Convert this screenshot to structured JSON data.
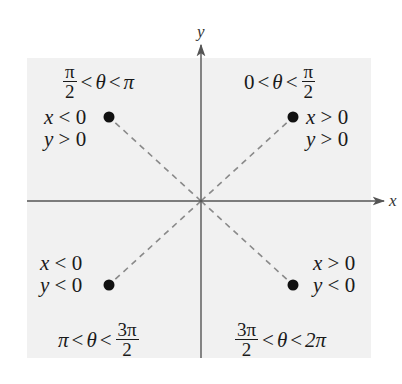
{
  "diagram": {
    "axes": {
      "x_label": "x",
      "y_label": "y"
    },
    "quadrants": [
      {
        "id": "Q1",
        "range": {
          "lower": "0",
          "theta": "θ",
          "upper_num": "π",
          "upper_den": "2",
          "lt": "<"
        },
        "conditions": [
          "x > 0",
          "y > 0"
        ],
        "cond_x": {
          "var": "x",
          "rel": " > 0"
        },
        "cond_y": {
          "var": "y",
          "rel": " > 0"
        }
      },
      {
        "id": "Q2",
        "range": {
          "lower_num": "π",
          "lower_den": "2",
          "theta": "θ",
          "upper": "π",
          "lt": "<"
        },
        "conditions": [
          "x < 0",
          "y > 0"
        ],
        "cond_x": {
          "var": "x",
          "rel": " < 0"
        },
        "cond_y": {
          "var": "y",
          "rel": " > 0"
        }
      },
      {
        "id": "Q3",
        "range": {
          "lower": "π",
          "theta": "θ",
          "upper_num": "3π",
          "upper_den": "2",
          "lt": "<"
        },
        "conditions": [
          "x < 0",
          "y < 0"
        ],
        "cond_x": {
          "var": "x",
          "rel": " < 0"
        },
        "cond_y": {
          "var": "y",
          "rel": " < 0"
        }
      },
      {
        "id": "Q4",
        "range": {
          "lower_num": "3π",
          "lower_den": "2",
          "theta": "θ",
          "upper": "2π",
          "lt": "<"
        },
        "conditions": [
          "x > 0",
          "y < 0"
        ],
        "cond_x": {
          "var": "x",
          "rel": " > 0"
        },
        "cond_y": {
          "var": "y",
          "rel": " < 0"
        }
      }
    ],
    "colors": {
      "panel": "#f1f1f1",
      "axis": "#555555",
      "dash": "#8a8a8a",
      "point": "#111111"
    }
  }
}
